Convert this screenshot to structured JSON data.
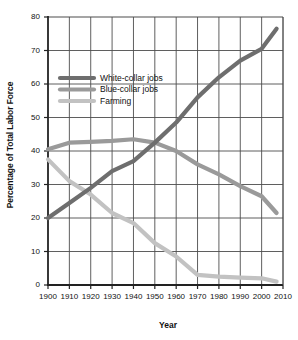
{
  "chart_data": {
    "type": "line",
    "title": "",
    "xlabel": "Year",
    "ylabel": "Percentage of Total Labor Force",
    "xlim": [
      1900,
      2010
    ],
    "ylim": [
      0,
      80
    ],
    "xticks": [
      "1900",
      "1910",
      "1920",
      "1930",
      "1940",
      "1950",
      "1960",
      "1970",
      "1980",
      "1990",
      "2000",
      "2010"
    ],
    "yticks": [
      "0",
      "10",
      "20",
      "30",
      "40",
      "50",
      "60",
      "70",
      "80"
    ],
    "grid": true,
    "legend_position": "upper-left-inside",
    "x": [
      1900,
      1910,
      1920,
      1930,
      1940,
      1950,
      1960,
      1970,
      1980,
      1990,
      2000,
      2007
    ],
    "series": [
      {
        "name": "White-collar jobs",
        "color": "#6e6e6e",
        "values": [
          20,
          24.5,
          29,
          34,
          37,
          42.5,
          48.5,
          56,
          62,
          67,
          70.5,
          76.5
        ]
      },
      {
        "name": "Blue-collar jobs",
        "color": "#9a9a9a",
        "values": [
          40.5,
          42.5,
          42.7,
          43,
          43.5,
          42.5,
          40,
          36,
          33,
          29.5,
          26.5,
          21.5
        ]
      },
      {
        "name": "Farming",
        "color": "#c2c2c2",
        "values": [
          37.5,
          31,
          27,
          21.5,
          18.5,
          12.5,
          8.5,
          3,
          2.5,
          2.2,
          2,
          1
        ]
      }
    ]
  },
  "legend": {
    "items": [
      {
        "label": "White-collar jobs",
        "color": "#6e6e6e"
      },
      {
        "label": "Blue-collar jobs",
        "color": "#9a9a9a"
      },
      {
        "label": "Farming",
        "color": "#c2c2c2"
      }
    ]
  },
  "axes": {
    "x_title": "Year",
    "y_title": "Percentage of Total Labor Force"
  }
}
